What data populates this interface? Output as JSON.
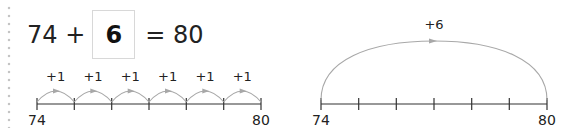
{
  "equation": {
    "left_operand": "74",
    "operator": "+",
    "answer": "6",
    "equals": "=",
    "result": "80"
  },
  "number_line_small_steps": {
    "start_label": "74",
    "end_label": "80",
    "ticks": 7,
    "jumps": [
      "+1",
      "+1",
      "+1",
      "+1",
      "+1",
      "+1"
    ]
  },
  "number_line_big_jump": {
    "start_label": "74",
    "end_label": "80",
    "ticks": 7,
    "jump_label": "+6"
  },
  "colors": {
    "text": "#222222",
    "line": "#333333",
    "arc": "#a8a8a8",
    "box_border": "#d8d8d8",
    "dots": "#c4c4c4"
  }
}
